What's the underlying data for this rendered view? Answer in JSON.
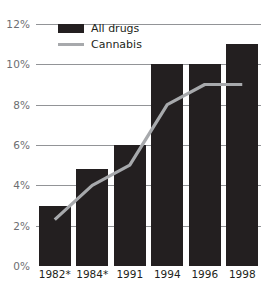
{
  "chart_data": {
    "type": "bar",
    "title": "",
    "subtitle": "",
    "xlabel": "",
    "ylabel": "",
    "categories": [
      "1982*",
      "1984*",
      "1991",
      "1994",
      "1996",
      "1998"
    ],
    "ylim": [
      0,
      12
    ],
    "y_ticks": [
      0,
      2,
      4,
      6,
      8,
      10,
      12
    ],
    "y_tick_labels": [
      "0%",
      "2%",
      "4%",
      "6%",
      "8%",
      "10%",
      "12%"
    ],
    "grid": true,
    "legend_position": "top-left-inside",
    "series": [
      {
        "name": "All drugs",
        "type": "bar",
        "color": "#231f20",
        "values": [
          3.0,
          4.8,
          6.0,
          10.0,
          10.0,
          11.0
        ]
      },
      {
        "name": "Cannabis",
        "type": "line",
        "color": "#a7a9ac",
        "values": [
          2.3,
          4.0,
          5.0,
          8.0,
          9.0,
          9.0
        ]
      }
    ]
  },
  "legend": {
    "items": [
      {
        "label": "All drugs",
        "marker": "bar-swatch",
        "color": "#231f20"
      },
      {
        "label": "Cannabis",
        "marker": "line-swatch",
        "color": "#a7a9ac"
      }
    ]
  },
  "colors": {
    "bar": "#231f20",
    "line": "#a7a9ac",
    "gridline": "#929497",
    "axis_label": "#6d6e71",
    "tick_label": "#231f20",
    "background": "#ffffff"
  }
}
